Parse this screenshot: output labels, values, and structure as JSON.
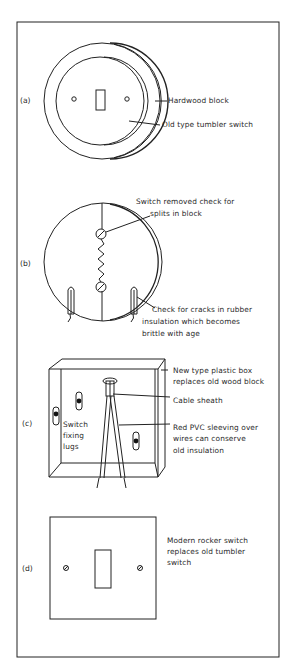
{
  "figure": {
    "panels": [
      {
        "id": "a",
        "label": "(a)",
        "callouts": [
          "Hardwood block",
          "Old type tumbler switch"
        ]
      },
      {
        "id": "b",
        "label": "(b)",
        "callouts": [
          "Switch removed check for",
          "splits in block",
          "Check for cracks in rubber",
          "insulation  which becomes",
          "brittle with age"
        ]
      },
      {
        "id": "c",
        "label": "(c)",
        "callouts": [
          "New type plastic box",
          "replaces old wood block",
          "Cable sheath",
          "Red PVC sleeving over",
          "wires can conserve",
          "old insulation",
          "Switch",
          "fixing",
          "lugs"
        ]
      },
      {
        "id": "d",
        "label": "(d)",
        "callouts": [
          "Modern rocker switch",
          "replaces old tumbler",
          "switch"
        ]
      }
    ],
    "line_color": "#222222"
  }
}
